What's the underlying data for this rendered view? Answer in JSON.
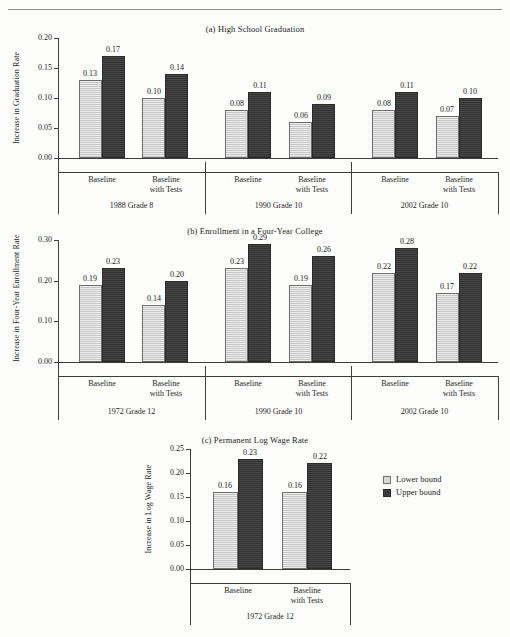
{
  "header": {
    "running_head": "",
    "rule_visible": true
  },
  "legend": {
    "position": "right-of-panel-c",
    "entries": [
      {
        "label": "Lower bound",
        "color": "#d6d6d6",
        "key": "lower"
      },
      {
        "label": "Upper bound",
        "color": "#3a3a3a",
        "key": "upper"
      }
    ]
  },
  "category_labels": {
    "baseline": [
      "Baseline"
    ],
    "baseline_with_tests": [
      "Baseline",
      "with Tests"
    ]
  },
  "chart_data": [
    {
      "id": "panel-a",
      "type": "bar",
      "title": "(a) High School Graduation",
      "ylabel": "Increase in Graduation Rate",
      "xlabel": "",
      "ylim": [
        0.0,
        0.2
      ],
      "yticks": [
        0.0,
        0.05,
        0.1,
        0.15,
        0.2
      ],
      "ytick_labels": [
        "0.00",
        "0.05",
        "0.10",
        "0.15",
        "0.20"
      ],
      "grid": false,
      "groups": [
        "1988 Grade 8",
        "1990 Grade 10",
        "2002 Grade 10"
      ],
      "categories": [
        "Baseline",
        "Baseline with Tests"
      ],
      "series": [
        {
          "name": "Lower bound",
          "values": [
            0.13,
            0.1,
            0.08,
            0.06,
            0.08,
            0.07
          ]
        },
        {
          "name": "Upper bound",
          "values": [
            0.17,
            0.14,
            0.11,
            0.09,
            0.11,
            0.1
          ]
        }
      ],
      "value_labels": [
        [
          "0.13",
          "0.17"
        ],
        [
          "0.10",
          "0.14"
        ],
        [
          "0.08",
          "0.11"
        ],
        [
          "0.06",
          "0.09"
        ],
        [
          "0.08",
          "0.11"
        ],
        [
          "0.07",
          "0.10"
        ]
      ]
    },
    {
      "id": "panel-b",
      "type": "bar",
      "title": "(b) Enrollment in a Four-Year College",
      "ylabel": "Increase in Four-Year Enrollment Rate",
      "xlabel": "",
      "ylim": [
        0.0,
        0.3
      ],
      "yticks": [
        0.0,
        0.1,
        0.2,
        0.3
      ],
      "ytick_labels": [
        "0.00",
        "0.10",
        "0.20",
        "0.30"
      ],
      "grid": false,
      "groups": [
        "1972 Grade 12",
        "1990 Grade 10",
        "2002 Grade 10"
      ],
      "categories": [
        "Baseline",
        "Baseline with Tests"
      ],
      "series": [
        {
          "name": "Lower bound",
          "values": [
            0.19,
            0.14,
            0.23,
            0.19,
            0.22,
            0.17
          ]
        },
        {
          "name": "Upper bound",
          "values": [
            0.23,
            0.2,
            0.29,
            0.26,
            0.28,
            0.22
          ]
        }
      ],
      "value_labels": [
        [
          "0.19",
          "0.23"
        ],
        [
          "0.14",
          "0.20"
        ],
        [
          "0.23",
          "0.29"
        ],
        [
          "0.19",
          "0.26"
        ],
        [
          "0.22",
          "0.28"
        ],
        [
          "0.17",
          "0.22"
        ]
      ]
    },
    {
      "id": "panel-c",
      "type": "bar",
      "title": "(c) Permanent Log Wage Rate",
      "ylabel": "Increase in Log Wage Rate",
      "xlabel": "",
      "ylim": [
        0.0,
        0.25
      ],
      "yticks": [
        0.0,
        0.05,
        0.1,
        0.15,
        0.2,
        0.25
      ],
      "ytick_labels": [
        "0.00",
        "0.05",
        "0.10",
        "0.15",
        "0.20",
        "0.25"
      ],
      "grid": false,
      "groups": [
        "1972 Grade 12"
      ],
      "categories": [
        "Baseline",
        "Baseline with Tests"
      ],
      "series": [
        {
          "name": "Lower bound",
          "values": [
            0.16,
            0.16
          ]
        },
        {
          "name": "Upper bound",
          "values": [
            0.23,
            0.22
          ]
        }
      ],
      "value_labels": [
        [
          "0.16",
          "0.23"
        ],
        [
          "0.16",
          "0.22"
        ]
      ]
    }
  ]
}
